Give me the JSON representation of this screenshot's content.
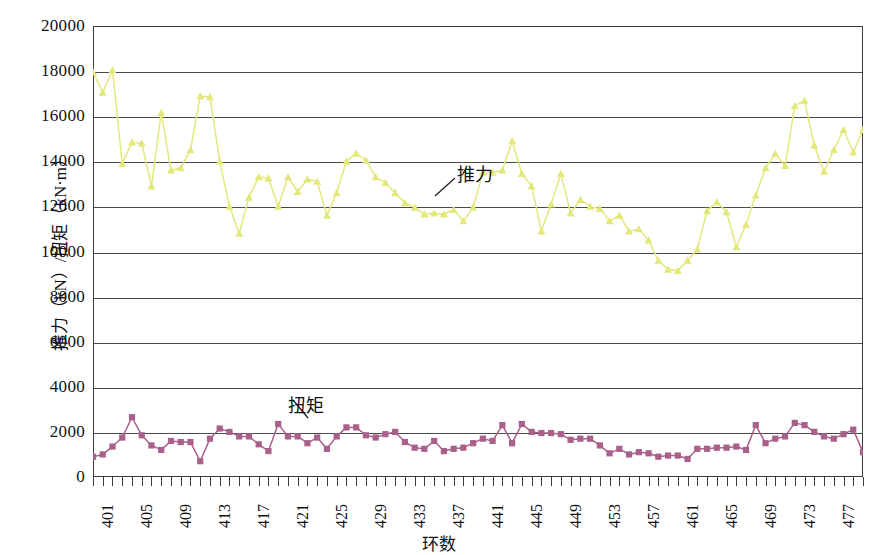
{
  "chart_data": {
    "type": "line",
    "title": "",
    "xlabel": "环数",
    "ylabel": "推力（kN）/扭矩（kN·m）",
    "ylim": [
      0,
      20000
    ],
    "ytick_step": 2000,
    "yticks": [
      "20000",
      "18000",
      "16000",
      "14000",
      "12000",
      "10000",
      "8000",
      "6000",
      "4000",
      "2000",
      "0"
    ],
    "xlim": [
      401,
      480
    ],
    "xtick_step": 4,
    "xticks": [
      "401",
      "405",
      "409",
      "413",
      "417",
      "421",
      "425",
      "429",
      "433",
      "437",
      "441",
      "445",
      "449",
      "453",
      "457",
      "461",
      "465",
      "469",
      "473",
      "477"
    ],
    "grid": "horizontal",
    "legend": "annotations",
    "annotations": [
      {
        "text": "推力",
        "series": "thrust"
      },
      {
        "text": "扭矩",
        "series": "torque"
      }
    ],
    "x": [
      401,
      402,
      403,
      404,
      405,
      406,
      407,
      408,
      409,
      410,
      411,
      412,
      413,
      414,
      415,
      416,
      417,
      418,
      419,
      420,
      421,
      422,
      423,
      424,
      425,
      426,
      427,
      428,
      429,
      430,
      431,
      432,
      433,
      434,
      435,
      436,
      437,
      438,
      439,
      440,
      441,
      442,
      443,
      444,
      445,
      446,
      447,
      448,
      449,
      450,
      451,
      452,
      453,
      454,
      455,
      456,
      457,
      458,
      459,
      460,
      461,
      462,
      463,
      464,
      465,
      466,
      467,
      468,
      469,
      470,
      471,
      472,
      473,
      474,
      475,
      476,
      477,
      478,
      479,
      480
    ],
    "series": [
      {
        "name": "推力",
        "key": "thrust",
        "unit": "kN",
        "color": "#e3e87a",
        "marker": "triangle",
        "values": [
          17950,
          17050,
          18050,
          13900,
          14850,
          14800,
          12900,
          16150,
          13600,
          13700,
          14500,
          16900,
          16850,
          14000,
          12000,
          10800,
          12400,
          13300,
          13250,
          12000,
          13300,
          12650,
          13200,
          13100,
          11600,
          12600,
          14000,
          14350,
          14050,
          13300,
          13050,
          12600,
          12150,
          11950,
          11650,
          11700,
          11650,
          11850,
          11350,
          11950,
          13500,
          13500,
          13600,
          14900,
          13450,
          12900,
          10900,
          12100,
          13450,
          11700,
          12300,
          12000,
          11900,
          11350,
          11600,
          10900,
          11000,
          10500,
          9600,
          9200,
          9150,
          9600,
          10100,
          11800,
          12200,
          11750,
          10200,
          11200,
          12500,
          13700,
          14350,
          13800,
          16450,
          16700,
          14700,
          13550,
          14500,
          15400,
          14400,
          15400
        ]
      },
      {
        "name": "扭矩",
        "key": "torque",
        "unit": "kN·m",
        "color": "#a9608a",
        "marker": "square",
        "values": [
          900,
          1000,
          1350,
          1750,
          2650,
          1850,
          1400,
          1200,
          1600,
          1550,
          1550,
          700,
          1700,
          2150,
          2000,
          1800,
          1800,
          1450,
          1150,
          2350,
          1800,
          1800,
          1500,
          1750,
          1250,
          1800,
          2200,
          2200,
          1850,
          1750,
          1900,
          2000,
          1550,
          1300,
          1250,
          1600,
          1150,
          1250,
          1300,
          1500,
          1700,
          1600,
          2300,
          1500,
          2350,
          2000,
          1950,
          1950,
          1900,
          1650,
          1700,
          1700,
          1400,
          1050,
          1250,
          1000,
          1100,
          1050,
          900,
          950,
          950,
          800,
          1250,
          1250,
          1300,
          1300,
          1350,
          1200,
          2300,
          1500,
          1700,
          1800,
          2400,
          2300,
          2000,
          1800,
          1700,
          1900,
          2100,
          1100
        ]
      }
    ]
  }
}
